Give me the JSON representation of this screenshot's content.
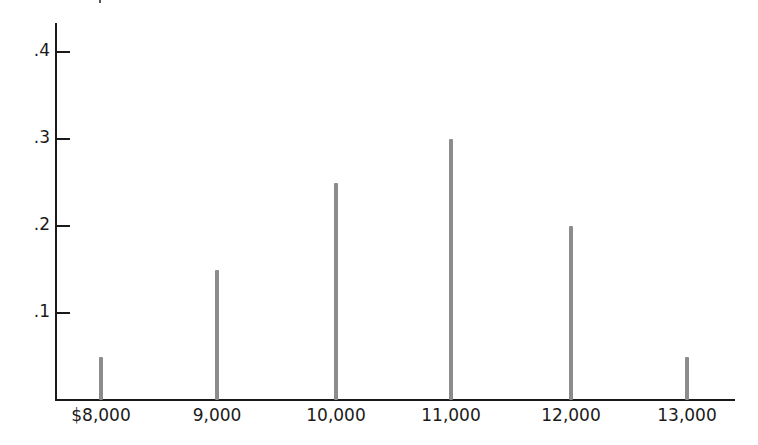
{
  "chart_data": {
    "type": "bar",
    "title": "",
    "xlabel": "",
    "ylabel": "",
    "categories": [
      "$8,000",
      "9,000",
      "10,000",
      "11,000",
      "12,000",
      "13,000"
    ],
    "x": [
      8000,
      9000,
      10000,
      11000,
      12000,
      13000
    ],
    "values": [
      0.05,
      0.15,
      0.25,
      0.3,
      0.2,
      0.05
    ],
    "yticks": [
      ".1",
      ".2",
      ".3",
      ".4"
    ],
    "ylim": [
      0,
      0.4
    ],
    "grid": false,
    "legend": null,
    "style": "spike / line-bar probability distribution",
    "bar_color": "#8c8c8c"
  }
}
